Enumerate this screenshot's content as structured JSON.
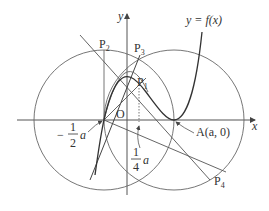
{
  "diagram": {
    "curve_label": "y = f(x)",
    "axis_x": "x",
    "axis_y": "y",
    "origin": "O",
    "points": {
      "P1": "P",
      "P1_sub": "1",
      "P2": "P",
      "P2_sub": "2",
      "P3": "P",
      "P3_sub": "3",
      "P4": "P",
      "P4_sub": "4",
      "A": "A(a, 0)"
    },
    "annotations": {
      "neg_half_a_num": "1",
      "neg_half_a_den": "2",
      "neg_half_a_sign": "−",
      "neg_half_a_var": "a",
      "quarter_a_num": "1",
      "quarter_a_den": "4",
      "quarter_a_var": "a"
    },
    "colors": {
      "stroke": "#555555",
      "text": "#333333"
    }
  }
}
